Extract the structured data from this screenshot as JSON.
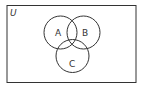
{
  "diagram": {
    "type": "venn",
    "universe_label": "U",
    "sets": [
      {
        "label": "A"
      },
      {
        "label": "B"
      },
      {
        "label": "C"
      }
    ],
    "colors": {
      "stroke": "#333333",
      "background": "#ffffff"
    }
  }
}
